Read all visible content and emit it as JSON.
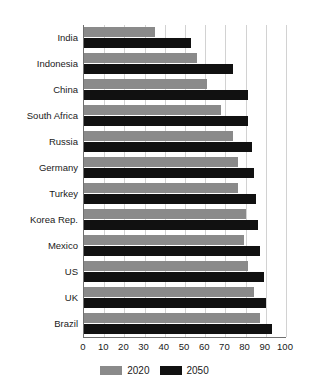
{
  "chart_data": {
    "type": "bar",
    "orientation": "horizontal",
    "title": "",
    "xlabel": "",
    "ylabel": "",
    "xlim": [
      0,
      100
    ],
    "xticks": [
      0,
      10,
      20,
      30,
      40,
      50,
      60,
      70,
      80,
      90,
      100
    ],
    "grid": true,
    "legend_position": "bottom",
    "categories": [
      "India",
      "Indonesia",
      "China",
      "South Africa",
      "Russia",
      "Germany",
      "Turkey",
      "Korea Rep.",
      "Mexico",
      "US",
      "UK",
      "Brazil"
    ],
    "series": [
      {
        "name": "2020",
        "color": "#8a8a8a",
        "values": [
          35,
          56,
          61,
          68,
          74,
          76,
          76,
          80,
          79,
          81,
          84,
          87
        ]
      },
      {
        "name": "2050",
        "color": "#111111",
        "values": [
          53,
          74,
          81,
          81,
          83,
          84,
          85,
          86,
          87,
          89,
          90,
          93
        ]
      }
    ]
  },
  "legend": {
    "entries": [
      {
        "label": "2020",
        "color": "#8a8a8a"
      },
      {
        "label": "2050",
        "color": "#111111"
      }
    ]
  },
  "axis": {
    "tick_labels": [
      "0",
      "10",
      "20",
      "30",
      "40",
      "50",
      "60",
      "70",
      "80",
      "90",
      "100"
    ]
  },
  "colors": {
    "series_2020": "#8a8a8a",
    "series_2050": "#111111",
    "gridline": "#d2d2d2",
    "axis": "#6f6f6f",
    "background": "#ffffff"
  }
}
